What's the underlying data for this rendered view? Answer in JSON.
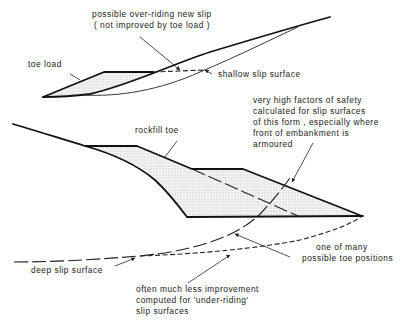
{
  "diagram": {
    "top_figure": {
      "labels": {
        "overriding_line1": "possible over-riding new slip",
        "overriding_line2": "( not improved by toe load )",
        "toe_load": "toe load",
        "shallow_slip": "shallow slip surface"
      }
    },
    "bottom_figure": {
      "labels": {
        "rockfill_toe": "rockfill toe",
        "safety_line1": "very high factors of safety",
        "safety_line2": "calculated for slip surfaces",
        "safety_line3": "of this form , especially where",
        "safety_line4": "front of embankment is",
        "safety_line5": "armoured",
        "toe_positions_line1": "one of many",
        "toe_positions_line2": "possible toe positions",
        "deep_slip": "deep slip surface",
        "underriding_line1": "often much less improvement",
        "underriding_line2": "computed for 'under-riding'",
        "underriding_line3": "slip surfaces"
      }
    },
    "colors": {
      "line": "#111111",
      "background": "#ffffff",
      "stipple": "#777777"
    }
  }
}
